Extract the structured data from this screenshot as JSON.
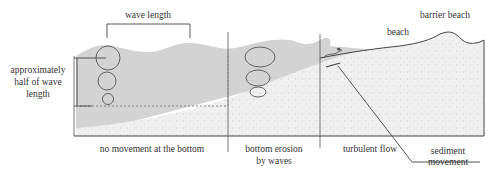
{
  "diagram": {
    "title_labels": {
      "wave_length": "wave length",
      "barrier_beach": "barrier beach",
      "beach": "beach"
    },
    "depth_annotation": {
      "line1": "approximately",
      "line2": "half of wave",
      "line3": "length"
    },
    "zones": [
      {
        "line1": "no movement at the bottom",
        "line2": ""
      },
      {
        "line1": "bottom erosion",
        "line2": "by waves"
      },
      {
        "line1": "turbulent flow",
        "line2": ""
      }
    ],
    "callout": {
      "line1": "sediment",
      "line2": "movement"
    },
    "colors": {
      "water": "#d4d4d4",
      "sediment": "#efefef",
      "line": "#444444",
      "orbit": "#555555"
    }
  }
}
